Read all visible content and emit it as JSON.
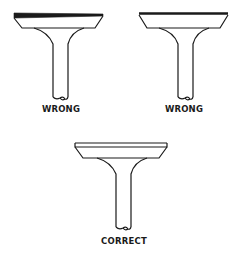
{
  "diagram": {
    "figures": [
      {
        "id": "wrong-1",
        "label": "WRONG",
        "description": "valve head with uneven, tapered top margin"
      },
      {
        "id": "wrong-2",
        "label": "WRONG",
        "description": "valve head with sharp, knife-edged top margin"
      },
      {
        "id": "correct",
        "label": "CORRECT",
        "description": "valve head with uniform top margin"
      }
    ],
    "colors": {
      "line": "#1a1a1a",
      "background": "#ffffff"
    }
  }
}
